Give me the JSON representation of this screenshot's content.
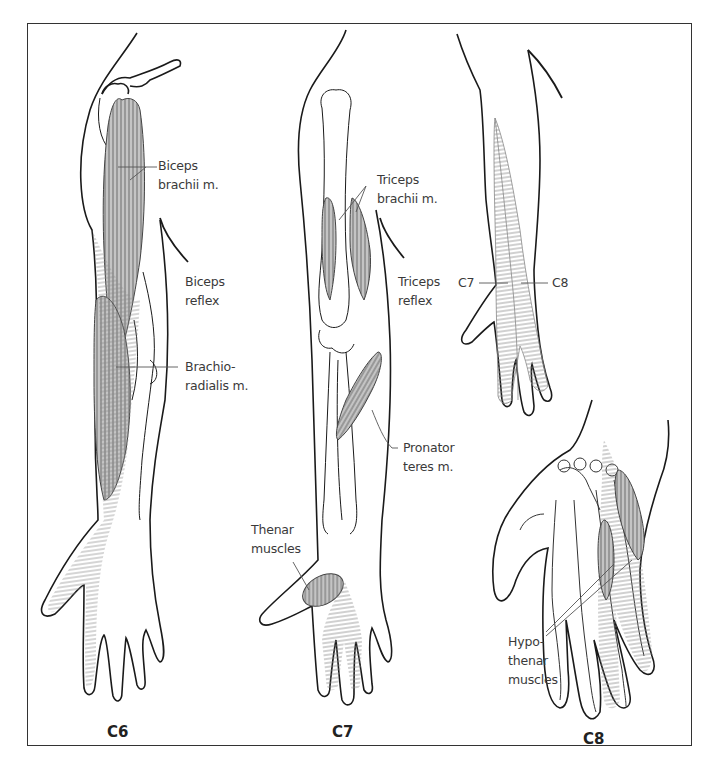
{
  "figure": {
    "panels": [
      {
        "id": "C6",
        "caption": "C6",
        "labels": {
          "biceps_brachii": [
            "Biceps",
            "brachii m."
          ],
          "biceps_reflex": [
            "Biceps",
            "reflex"
          ],
          "brachioradialis": [
            "Brachio-",
            "radialis m."
          ]
        }
      },
      {
        "id": "C7",
        "caption": "C7",
        "labels": {
          "triceps_brachii": [
            "Triceps",
            "brachii m."
          ],
          "triceps_reflex": [
            "Triceps",
            "reflex"
          ],
          "pronator_teres": [
            "Pronator",
            "teres m."
          ],
          "thenar_muscles": [
            "Thenar",
            "muscles"
          ]
        }
      },
      {
        "id": "C8",
        "caption": "C8",
        "labels": {
          "dermatome_c7": "C7",
          "dermatome_c8": "C8",
          "hypothenar_muscles": [
            "Hypo-",
            "thenar",
            "muscles"
          ]
        }
      }
    ],
    "colors": {
      "outline": "#1a1a1a",
      "muscle_fill": "#b9b9b9",
      "hatch": "#8a8a8a",
      "label_text": "#3a3a3a",
      "leader_line": "#555555"
    }
  }
}
